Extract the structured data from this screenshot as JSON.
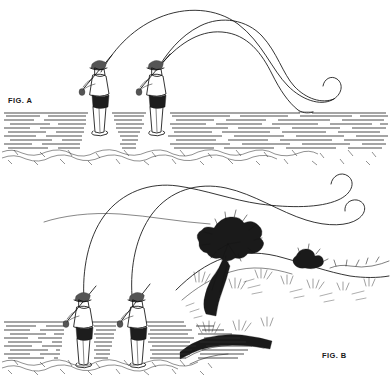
{
  "illustration": {
    "title": "Fly casting technique line drawing",
    "style": "black and white pen-and-ink line art",
    "background_color": "#ffffff",
    "ink_color": "#111111"
  },
  "panels": [
    {
      "id": "fig-a",
      "label": "FIG. A",
      "label_position": {
        "x": 8,
        "y": 103
      },
      "scene": "Two fly anglers standing in shallow water on a pebble bottom, rods raised, fly lines arcing in a wide high loop to the right and settling onto the water surface",
      "angler_count": 2,
      "water": {
        "type": "dashed-horizontal-lines",
        "top_y": 112,
        "bottom_y": 148,
        "row_count": 13
      },
      "shore": {
        "type": "pebbles",
        "top_y": 148,
        "bottom_y": 162
      },
      "line_description": "two long overlapping fly lines crossing near upper left, curling back at the right tip"
    },
    {
      "id": "fig-b",
      "label": "FIG. B",
      "label_position": {
        "x": 322,
        "y": 358
      },
      "scene": "Two fly anglers standing in water beside a grassy vegetated bank with a large bush, fly lines forming a flat narrow loop travelling to the right with curled tips",
      "angler_count": 2,
      "water": {
        "type": "dashed-horizontal-lines",
        "top_y": 320,
        "bottom_y": 358,
        "row_count": 12
      },
      "shore": {
        "type": "pebbles",
        "top_y": 358,
        "bottom_y": 372
      },
      "bank": {
        "description": "sloping earth bank rising to the right with a large leafy bush, smaller shrubs and grass tufts"
      },
      "line_description": "flat elongated casting loop with two small hook curls at the right end"
    }
  ],
  "anglers": [
    {
      "panel": "fig-a",
      "index": 0,
      "x": 95,
      "y": 68,
      "facing": "right-rear view",
      "wearing": "brimmed hat, jacket, waders",
      "holding": "fly rod angled up-left"
    },
    {
      "panel": "fig-a",
      "index": 1,
      "x": 152,
      "y": 68,
      "facing": "right-rear view",
      "wearing": "brimmed hat, jacket, waders",
      "holding": "fly rod angled up-left"
    },
    {
      "panel": "fig-b",
      "index": 0,
      "x": 78,
      "y": 300,
      "facing": "right-rear view",
      "wearing": "brimmed hat, jacket, waders",
      "holding": "fly rod angled up-left"
    },
    {
      "panel": "fig-b",
      "index": 1,
      "x": 132,
      "y": 300,
      "facing": "right-rear view",
      "wearing": "brimmed hat, jacket, waders",
      "holding": "fly rod angled up-left"
    }
  ]
}
